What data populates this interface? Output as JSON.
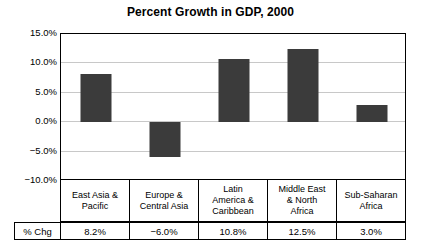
{
  "chart_data": {
    "type": "bar",
    "title": "Percent Growth in GDP, 2000",
    "xlabel": "",
    "ylabel": "",
    "ylim": [
      -10,
      15
    ],
    "grid": true,
    "legend": "none",
    "categories": [
      "East Asia & Pacific",
      "Europe & Central Asia",
      "Latin America & Caribbean",
      "Middle East & North Africa",
      "Sub-Saharan Africa"
    ],
    "values": [
      8.2,
      -6.0,
      10.8,
      12.5,
      3.0
    ],
    "value_labels": [
      "8.2%",
      "−6.0%",
      "10.8%",
      "12.5%",
      "3.0%"
    ],
    "yticks": [
      15,
      10,
      5,
      0,
      -5,
      -10
    ],
    "ytick_labels": [
      "15.0%",
      "10.0%",
      "5.0%",
      "0.0%",
      "−5.0%",
      "−10.0%"
    ],
    "bar_color": "#3b3b3b",
    "gridline_color": "#c8c8c8",
    "axis_color": "#000000"
  },
  "table": {
    "row_label": "% Chg",
    "category_lines": [
      [
        "East Asia &",
        "Pacific"
      ],
      [
        "Europe &",
        "Central Asia"
      ],
      [
        "Latin",
        "America &",
        "Caribbean"
      ],
      [
        "Middle East",
        "& North",
        "Africa"
      ],
      [
        "Sub-Saharan",
        "Africa"
      ]
    ]
  }
}
